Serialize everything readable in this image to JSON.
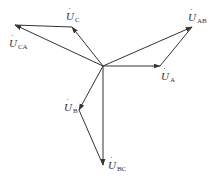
{
  "diagram": {
    "type": "phasor-diagram",
    "origin": {
      "x": 103,
      "y": 66
    },
    "line_color": "#333333",
    "phasors": [
      {
        "id": "UA",
        "symbol": "U",
        "subscript": "A",
        "from": {
          "x": 103,
          "y": 66
        },
        "to": {
          "x": 160,
          "y": 66
        }
      },
      {
        "id": "UB",
        "symbol": "U",
        "subscript": "B",
        "from": {
          "x": 103,
          "y": 66
        },
        "to": {
          "x": 79,
          "y": 110
        }
      },
      {
        "id": "UC",
        "symbol": "U",
        "subscript": "C",
        "from": {
          "x": 103,
          "y": 66
        },
        "to": {
          "x": 72,
          "y": 27
        }
      },
      {
        "id": "UAB",
        "symbol": "U",
        "subscript": "AB",
        "from": {
          "x": 103,
          "y": 66
        },
        "to": {
          "x": 192,
          "y": 27
        }
      },
      {
        "id": "UBC",
        "symbol": "U",
        "subscript": "BC",
        "from": {
          "x": 103,
          "y": 66
        },
        "to": {
          "x": 103,
          "y": 165
        }
      },
      {
        "id": "UCA",
        "symbol": "U",
        "subscript": "CA",
        "from": {
          "x": 103,
          "y": 66
        },
        "to": {
          "x": 15,
          "y": 25
        }
      }
    ],
    "connectors": [
      {
        "id": "A-to-AB",
        "from": {
          "x": 160,
          "y": 66
        },
        "to": {
          "x": 192,
          "y": 27
        }
      },
      {
        "id": "C-to-CA",
        "from": {
          "x": 72,
          "y": 27
        },
        "to": {
          "x": 15,
          "y": 25
        }
      },
      {
        "id": "B-to-BC",
        "from": {
          "x": 79,
          "y": 110
        },
        "to": {
          "x": 103,
          "y": 165
        }
      }
    ],
    "labels": {
      "UC": {
        "main": "U",
        "dot": "˙",
        "sub": "C"
      },
      "UCA": {
        "main": "U",
        "dot": "˙",
        "sub": "CA"
      },
      "UAB": {
        "main": "U",
        "dot": "˙",
        "sub": "AB"
      },
      "UA": {
        "main": "U",
        "dot": "˙",
        "sub": "A"
      },
      "UB": {
        "main": "U",
        "dot": "˙",
        "sub": "B"
      },
      "UBC": {
        "main": "U",
        "dot": "˙",
        "sub": "BC"
      }
    }
  }
}
